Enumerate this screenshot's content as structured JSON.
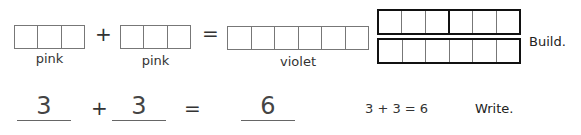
{
  "build_row": {
    "addend1": {
      "cells": 3,
      "color_label": "pink"
    },
    "plus": "+",
    "addend2": {
      "cells": 3,
      "color_label": "pink"
    },
    "equals": "=",
    "sum": {
      "cells": 6,
      "color_label": "violet"
    },
    "model": {
      "top_bar": {
        "cells": 6,
        "split_after": 3
      },
      "bottom_bar": {
        "cells": 6
      }
    },
    "instruction": "Build."
  },
  "write_row": {
    "addend1": "3",
    "plus": "+",
    "addend2": "3",
    "equals": "=",
    "sum": "6",
    "equation": "3 + 3 = 6",
    "instruction": "Write."
  }
}
